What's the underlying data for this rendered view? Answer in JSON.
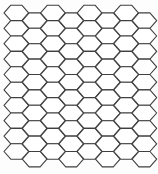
{
  "canvas": {
    "width": 158,
    "height": 174,
    "background": "#fdfdfd"
  },
  "honeycomb": {
    "pattern": "hexagonal-tessellation",
    "orientation": "flat-top",
    "columns": 8,
    "rows_per_column": 10,
    "hexagon_count": 80,
    "hex_width": 24.6,
    "hex_height": 15.4,
    "top_edge_length": 11,
    "origin_x": 4,
    "origin_y": 5.2,
    "column_pitch": 18.3,
    "row_pitch": 15.4,
    "odd_column_y_shift": 7.7,
    "stroke_color": "#3f3f3f",
    "stroke_width": 1.1,
    "cell_fill_color": "#ffffff"
  }
}
